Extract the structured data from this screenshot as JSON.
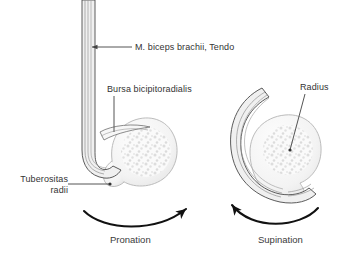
{
  "figure": {
    "background_color": "#ffffff",
    "width": 352,
    "height": 258
  },
  "labels": {
    "tendon": "M. biceps brachii, Tendo",
    "bursa": "Bursa bicipitoradialis",
    "tuberositas_line1": "Tuberositas",
    "tuberositas_line2": "radii",
    "radius": "Radius"
  },
  "captions": {
    "left": "Pronation",
    "right": "Supination"
  },
  "colors": {
    "outline": "#111111",
    "text": "#333333",
    "bone_fill": "#f4f4f4",
    "bone_stroke": "#bdbdbd",
    "trabecula": "#d8d8d8",
    "tendon_stroke": "#4a4a4a",
    "tendon_fill": "#efefef",
    "leader": "#5a5a5a"
  },
  "diagram": {
    "left_view": {
      "name": "pronation",
      "rotation_direction": "clockwise",
      "tendon_orientation": "vertical-straight",
      "bone": "radius-cross-section"
    },
    "right_view": {
      "name": "supination",
      "rotation_direction": "counter-clockwise",
      "tendon_orientation": "wrapped-around-bone",
      "bone": "radius-cross-section"
    }
  }
}
